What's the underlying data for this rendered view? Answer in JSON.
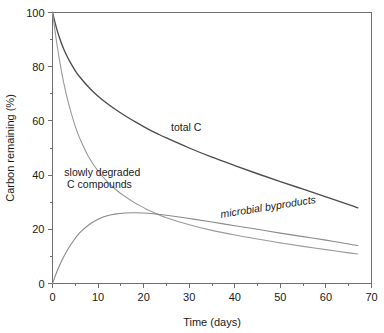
{
  "chart_data": {
    "type": "line",
    "title": "",
    "xlabel": "Time (days)",
    "ylabel": "Carbon remaining (%)",
    "xlim": [
      0,
      70
    ],
    "ylim": [
      0,
      100
    ],
    "grid": false,
    "legend_position": "inline-annotations",
    "x_ticks_major": [
      0,
      10,
      20,
      30,
      40,
      50,
      60,
      70
    ],
    "x_tick_labels": [
      "0",
      "10",
      "20",
      "30",
      "40",
      "50",
      "60",
      "70"
    ],
    "x_ticks_minor": [
      5,
      15,
      25,
      35,
      45,
      55,
      65
    ],
    "y_ticks_major": [
      0,
      20,
      40,
      60,
      80,
      100
    ],
    "y_tick_labels": [
      "0",
      "20",
      "40",
      "60",
      "80",
      "100"
    ],
    "y_ticks_minor": [
      10,
      30,
      50,
      70,
      90
    ],
    "x": [
      0,
      1,
      2,
      3,
      4,
      5,
      6,
      8,
      10,
      12,
      14,
      16,
      18,
      20,
      21,
      23,
      25,
      30,
      35,
      40,
      45,
      50,
      55,
      60,
      65,
      67
    ],
    "series": [
      {
        "name": "total C",
        "color": "#4d4d4d",
        "label": "total C",
        "label_x": 26,
        "label_y": 58,
        "values": [
          100,
          93.5,
          88.5,
          84.5,
          81.3,
          78.5,
          76.2,
          72.3,
          69.1,
          66.4,
          64.0,
          61.8,
          59.8,
          57.9,
          57.0,
          55.3,
          53.7,
          50.0,
          46.6,
          43.5,
          40.5,
          37.6,
          34.8,
          32.0,
          29.1,
          27.9
        ]
      },
      {
        "name": "slowly degraded C compounds",
        "color": "#9a9a9a",
        "label": "slowly degraded",
        "label2": "C compounds",
        "label_x": 5,
        "label_y": 40,
        "values": [
          100,
          88.0,
          78.0,
          70.0,
          63.5,
          58.0,
          53.5,
          46.5,
          41.5,
          37.6,
          34.5,
          32.0,
          29.8,
          28.0,
          27.1,
          25.6,
          24.3,
          21.7,
          19.6,
          17.9,
          16.4,
          15.0,
          13.7,
          12.5,
          11.3,
          10.9
        ]
      },
      {
        "name": "microbial byproducts",
        "color": "#8a8a8a",
        "label": "microbial byproducts",
        "label_x": 38,
        "label_y": 25,
        "values": [
          0,
          4.5,
          8.3,
          11.5,
          14.3,
          16.7,
          18.8,
          21.7,
          23.7,
          25.0,
          25.7,
          26.0,
          26.1,
          26.0,
          25.9,
          25.6,
          25.2,
          24.0,
          22.7,
          21.3,
          20.0,
          18.6,
          17.3,
          16.0,
          14.6,
          14.0
        ]
      }
    ]
  },
  "annotations": {
    "total_c": "total C",
    "slowly_degraded_line1": "slowly degraded",
    "slowly_degraded_line2": "C compounds",
    "microbial": "microbial byproducts"
  },
  "axes": {
    "x_title": "Time (days)",
    "y_title": "Carbon remaining (%)"
  }
}
